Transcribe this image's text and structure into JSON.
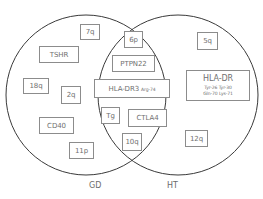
{
  "diagram": {
    "type": "venn",
    "sets": [
      {
        "id": "gd",
        "label": "GD"
      },
      {
        "id": "ht",
        "label": "HT"
      }
    ],
    "gd_only": [
      "7q",
      "TSHR",
      "18q",
      "2q",
      "CD40",
      "11p"
    ],
    "shared": [
      "6p",
      "PTPN22",
      "HLA-DR3",
      "Tg",
      "CTLA4",
      "10q"
    ],
    "ht_only": [
      "5q",
      "HLA-DR",
      "12q"
    ],
    "boxes": {
      "q7": "7q",
      "tshr": "TSHR",
      "q18": "18q",
      "q2": "2q",
      "cd40": "CD40",
      "p11": "11p",
      "p6": "6p",
      "ptpn22": "PTPN22",
      "hladr3": "HLA-DR3",
      "hladr3_sub": "Arg-74",
      "tg": "Tg",
      "ctla4": "CTLA4",
      "q10": "10q",
      "q5": "5q",
      "hladr": "HLA-DR",
      "hladr_line1": "Tyr-26 Tyr-30",
      "hladr_line2": "Gln-70 Lys-71",
      "q12": "12q"
    },
    "labels": {
      "gd": "GD",
      "ht": "HT"
    },
    "colors": {
      "circle_stroke": "#3a3a3a",
      "box_border": "#8c8c8c",
      "text": "#6b6b6b"
    }
  }
}
